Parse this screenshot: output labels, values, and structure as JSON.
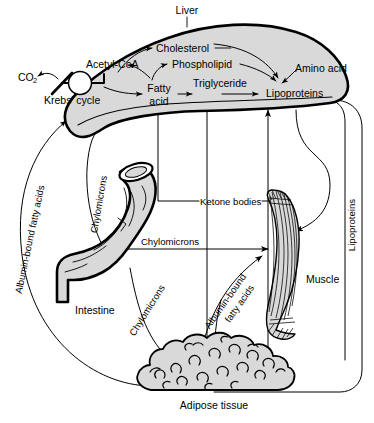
{
  "diagram": {
    "organs": {
      "liver": "Liver",
      "intestine": "Intestine",
      "muscle": "Muscle",
      "adipose": "Adipose tissue"
    },
    "liver_metabolites": {
      "acetyl_coa": "Acetyl-CoA",
      "krebs_cycle": "Krebs' cycle",
      "co2": "CO",
      "co2_sub": "2",
      "cholesterol": "Cholesterol",
      "phospholipid": "Phospholipid",
      "fatty_line1": "Fatty",
      "fatty_line2": "acid",
      "triglyceride": "Triglyceride",
      "lipoproteins": "Lipoproteins",
      "amino_acid": "Amino acid"
    },
    "transport_labels": {
      "albumin_left_line1": "Albumin-bound fatty",
      "albumin_left_line2": "acids",
      "albumin_left_full": "Albumin-bound fatty acids",
      "chylomicrons_vertical": "Chylomicrons",
      "chylomicrons_horizontal": "Chylomicrons",
      "chylomicrons_diagonal": "Chylomicrons",
      "ketone_bodies": "Ketone bodies",
      "lipoproteins_vertical": "Lipoproteins",
      "albumin_adipose_line1": "Albumin-bound",
      "albumin_adipose_line2": "fatty acids"
    },
    "colors": {
      "organ_fill": "#d9d9d9",
      "stroke": "#000000",
      "background": "#ffffff"
    }
  }
}
